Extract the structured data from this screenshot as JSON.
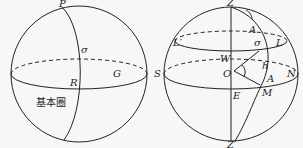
{
  "diagram_left": {
    "labels": {
      "P": "P",
      "sigma": "σ",
      "R": "R",
      "G": "G",
      "fundamental_circle": "基本圈"
    }
  },
  "diagram_right": {
    "labels": {
      "Z": "Z",
      "Z_prime": "Z′",
      "A_top": "A",
      "sigma": "σ",
      "L": "L",
      "L_prime": "L′",
      "W": "W",
      "h": "h",
      "S": "S",
      "O": "O",
      "N": "N",
      "A": "A",
      "M": "M",
      "E": "E"
    }
  }
}
